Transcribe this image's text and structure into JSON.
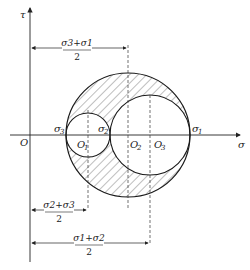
{
  "axes": {
    "x_label": "σ",
    "y_label": "τ",
    "origin_label": "O"
  },
  "points": {
    "sigma3": {
      "base": "σ",
      "sub": "3"
    },
    "sigma2": {
      "base": "σ",
      "sub": "2"
    },
    "sigma1": {
      "base": "σ",
      "sub": "1"
    }
  },
  "centers": {
    "O1": {
      "base": "O",
      "sub": "1"
    },
    "O2": {
      "base": "O",
      "sub": "2"
    },
    "O3": {
      "base": "O",
      "sub": "3"
    }
  },
  "dimensions": {
    "top": {
      "numerator": "σ3+σ1",
      "denominator": "2"
    },
    "middle": {
      "numerator": "σ2+σ3",
      "denominator": "2"
    },
    "bottom": {
      "numerator": "σ1+σ2",
      "denominator": "2"
    }
  },
  "colors": {
    "line": "#1a1a1a",
    "hatch": "#444444"
  }
}
